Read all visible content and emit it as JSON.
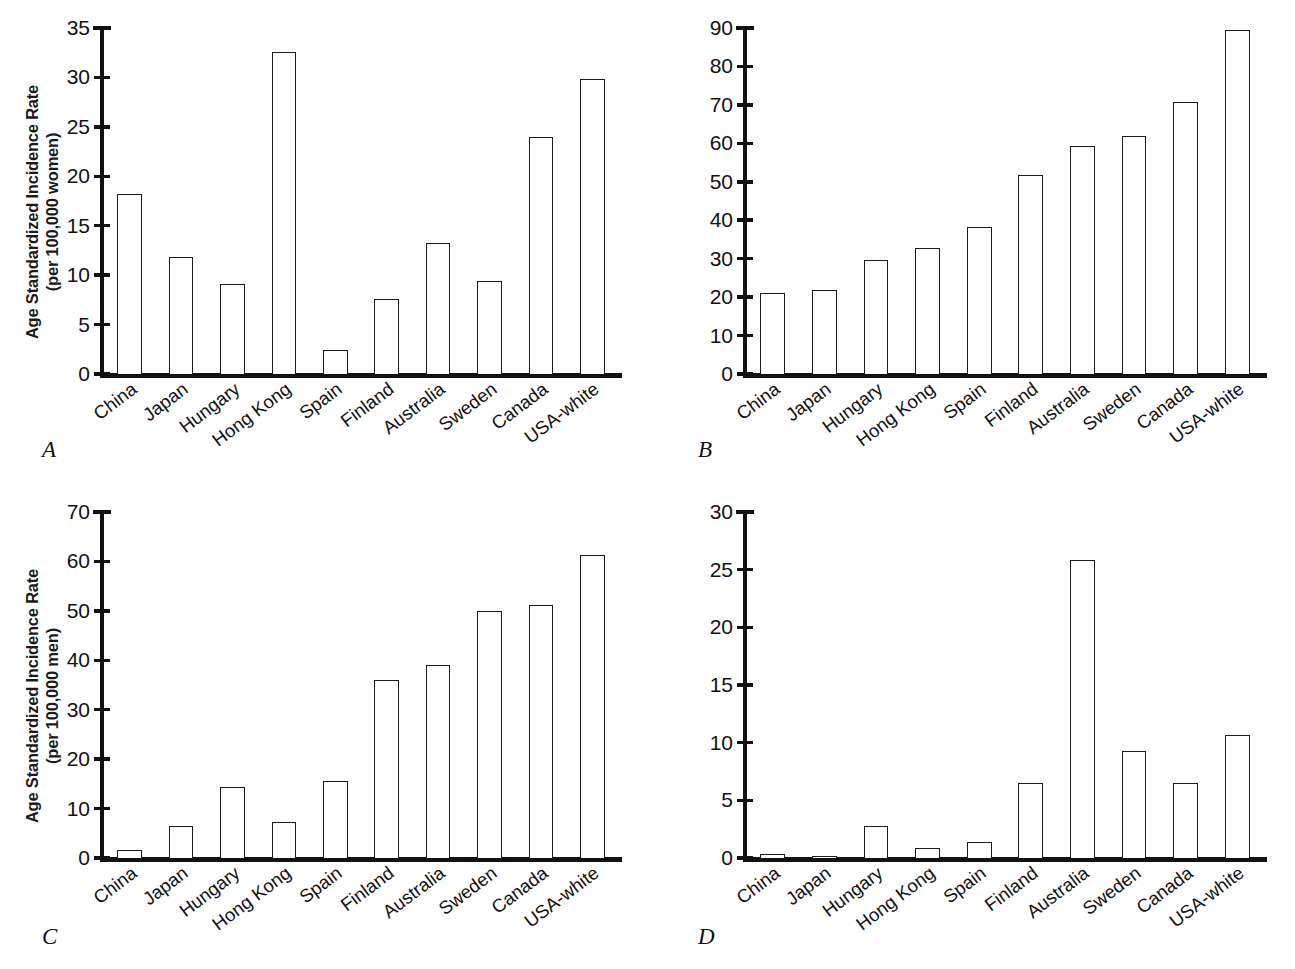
{
  "figure": {
    "categories": [
      "China",
      "Japan",
      "Hungary",
      "Hong Kong",
      "Spain",
      "Finland",
      "Australia",
      "Sweden",
      "Canada",
      "USA-white"
    ]
  },
  "panels": [
    {
      "letter": "A",
      "ylabel_line1": "Age Standardized Incidence Rate",
      "ylabel_line2": "(per 100,000 women)",
      "ticks": [
        "0",
        "5",
        "10",
        "15",
        "20",
        "25",
        "30",
        "35"
      ]
    },
    {
      "letter": "B",
      "ylabel_line1": "",
      "ylabel_line2": "",
      "ticks": [
        "0",
        "10",
        "20",
        "30",
        "40",
        "50",
        "60",
        "70",
        "80",
        "90"
      ]
    },
    {
      "letter": "C",
      "ylabel_line1": "Age Standardized Incidence Rate",
      "ylabel_line2": "(per 100,000 men)",
      "ticks": [
        "0",
        "10",
        "20",
        "30",
        "40",
        "50",
        "60",
        "70"
      ]
    },
    {
      "letter": "D",
      "ylabel_line1": "",
      "ylabel_line2": "",
      "ticks": [
        "0",
        "5",
        "10",
        "15",
        "20",
        "25",
        "30"
      ]
    }
  ],
  "chart_data": [
    {
      "type": "bar",
      "panel": "A",
      "title": "",
      "xlabel": "",
      "ylabel": "Age Standardized Incidence Rate (per 100,000 women)",
      "ylim": [
        0,
        35
      ],
      "ytick_step": 5,
      "grid": false,
      "legend": "none",
      "categories": [
        "China",
        "Japan",
        "Hungary",
        "Hong Kong",
        "Spain",
        "Finland",
        "Australia",
        "Sweden",
        "Canada",
        "USA-white"
      ],
      "values": [
        18.2,
        11.8,
        9.1,
        32.6,
        2.4,
        7.6,
        13.3,
        9.4,
        24.0,
        29.8
      ]
    },
    {
      "type": "bar",
      "panel": "B",
      "title": "",
      "xlabel": "",
      "ylabel": "",
      "ylim": [
        0,
        90
      ],
      "ytick_step": 10,
      "grid": false,
      "legend": "none",
      "categories": [
        "China",
        "Japan",
        "Hungary",
        "Hong Kong",
        "Spain",
        "Finland",
        "Australia",
        "Sweden",
        "Canada",
        "USA-white"
      ],
      "values": [
        21.0,
        21.9,
        29.6,
        32.7,
        38.3,
        51.8,
        59.3,
        61.8,
        70.8,
        89.4
      ]
    },
    {
      "type": "bar",
      "panel": "C",
      "title": "",
      "xlabel": "",
      "ylabel": "Age Standardized Incidence Rate (per 100,000 men)",
      "ylim": [
        0,
        70
      ],
      "ytick_step": 10,
      "grid": false,
      "legend": "none",
      "categories": [
        "China",
        "Japan",
        "Hungary",
        "Hong Kong",
        "Spain",
        "Finland",
        "Australia",
        "Sweden",
        "Canada",
        "USA-white"
      ],
      "values": [
        1.7,
        6.5,
        14.3,
        7.3,
        15.6,
        36.1,
        39.0,
        50.0,
        51.1,
        61.3
      ]
    },
    {
      "type": "bar",
      "panel": "D",
      "title": "",
      "xlabel": "",
      "ylabel": "",
      "ylim": [
        0,
        30
      ],
      "ytick_step": 5,
      "grid": false,
      "legend": "none",
      "categories": [
        "China",
        "Japan",
        "Hungary",
        "Hong Kong",
        "Spain",
        "Finland",
        "Australia",
        "Sweden",
        "Canada",
        "USA-white"
      ],
      "values": [
        0.35,
        0.2,
        2.8,
        0.85,
        1.4,
        6.5,
        25.8,
        9.3,
        6.5,
        10.7
      ]
    }
  ]
}
